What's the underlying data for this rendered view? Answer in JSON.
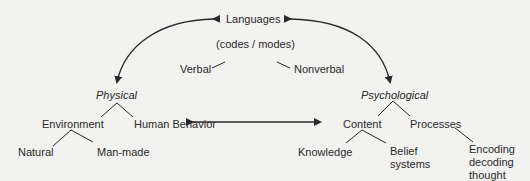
{
  "diagram": {
    "nodes": {
      "languages": "Languages",
      "codes_modes": "(codes / modes)",
      "verbal": "Verbal",
      "nonverbal": "Nonverbal",
      "physical": "Physical",
      "psychological": "Psychological",
      "environment": "Environment",
      "human_behavior": "Human Behavior",
      "natural": "Natural",
      "man_made": "Man-made",
      "content": "Content",
      "processes": "Processes",
      "knowledge": "Knowledge",
      "belief_systems": "Belief systems",
      "encoding": "Encoding decoding thought"
    },
    "edges": [
      {
        "from": "languages",
        "to": "physical",
        "type": "bidirectional-curved-arrow"
      },
      {
        "from": "languages",
        "to": "psychological",
        "type": "bidirectional-curved-arrow"
      },
      {
        "from": "physical",
        "to": "psychological",
        "type": "bidirectional-arrow"
      },
      {
        "from": "codes_modes",
        "to": "verbal",
        "type": "line"
      },
      {
        "from": "codes_modes",
        "to": "nonverbal",
        "type": "line"
      },
      {
        "from": "physical",
        "to": "environment",
        "type": "line"
      },
      {
        "from": "physical",
        "to": "human_behavior",
        "type": "line"
      },
      {
        "from": "environment",
        "to": "natural",
        "type": "line"
      },
      {
        "from": "environment",
        "to": "man_made",
        "type": "line"
      },
      {
        "from": "psychological",
        "to": "content",
        "type": "line"
      },
      {
        "from": "psychological",
        "to": "processes",
        "type": "line"
      },
      {
        "from": "content",
        "to": "knowledge",
        "type": "line"
      },
      {
        "from": "content",
        "to": "belief_systems",
        "type": "line"
      },
      {
        "from": "processes",
        "to": "encoding",
        "type": "line"
      }
    ],
    "colors": {
      "background": "#f2f2f0",
      "ink": "#2a2a2a"
    }
  }
}
